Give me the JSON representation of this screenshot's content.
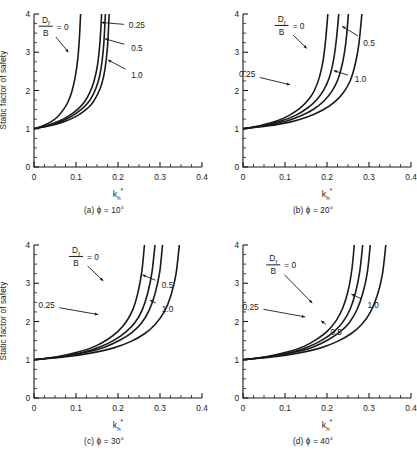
{
  "figure": {
    "axis_labels": {
      "y": "Static factor of safety",
      "x_main": "k",
      "x_sub": "h",
      "x_sup": "*"
    },
    "legend_key": {
      "numerator": "D",
      "numerator_sub": "f",
      "denominator": "B",
      "equals_value": "= 0"
    },
    "x_ticks": [
      "0",
      "0.1",
      "0.2",
      "0.3",
      "0.4"
    ],
    "y_ticks": [
      "0",
      "1.0",
      "2.0",
      "3.0",
      "4.0"
    ],
    "colors": {
      "ink": "#1a1a1a",
      "background": "#ffffff"
    }
  },
  "panels": [
    {
      "id": "a",
      "caption": "(a) ϕ = 10°",
      "phi": 10,
      "labels": [
        "0.25",
        "0.5",
        "1.0"
      ]
    },
    {
      "id": "b",
      "caption": "(b) ϕ = 20°",
      "phi": 20,
      "labels": [
        "0.25",
        "0.5",
        "1.0"
      ]
    },
    {
      "id": "c",
      "caption": "(c) ϕ = 30°",
      "phi": 30,
      "labels": [
        "0.25",
        "0.5",
        "1.0"
      ]
    },
    {
      "id": "d",
      "caption": "(d) ϕ = 40°",
      "phi": 40,
      "labels": [
        "0.25",
        "0.5",
        "1.0"
      ]
    }
  ],
  "chart_data": {
    "type": "line",
    "title": "",
    "xlabel": "k*h (horizontal seismic coefficient)",
    "ylabel": "Static factor of safety",
    "xlim": [
      0,
      0.4
    ],
    "ylim": [
      0,
      4.0
    ],
    "xticks": [
      0,
      0.1,
      0.2,
      0.3,
      0.4
    ],
    "yticks": [
      0,
      1.0,
      2.0,
      3.0,
      4.0
    ],
    "grid": false,
    "legend_position": "in-plot-annotations",
    "series_parameter": "Df/B",
    "panels": [
      {
        "panel": "a",
        "phi_deg": 10,
        "caption": "(a) ϕ = 10°",
        "series": [
          {
            "name": "0",
            "x": [
              0.0,
              0.02,
              0.04,
              0.055,
              0.07,
              0.08,
              0.09,
              0.098,
              0.104,
              0.108,
              0.111
            ],
            "values": [
              1.0,
              1.07,
              1.18,
              1.3,
              1.5,
              1.68,
              1.97,
              2.35,
              2.8,
              3.35,
              4.0
            ]
          },
          {
            "name": "0.25",
            "x": [
              0.0,
              0.03,
              0.06,
              0.085,
              0.105,
              0.12,
              0.133,
              0.143,
              0.151,
              0.157,
              0.161
            ],
            "values": [
              1.0,
              1.08,
              1.2,
              1.35,
              1.52,
              1.7,
              1.95,
              2.25,
              2.65,
              3.25,
              4.0
            ]
          },
          {
            "name": "0.5",
            "x": [
              0.0,
              0.032,
              0.064,
              0.09,
              0.112,
              0.128,
              0.141,
              0.152,
              0.16,
              0.166,
              0.17
            ],
            "values": [
              1.0,
              1.08,
              1.19,
              1.33,
              1.5,
              1.67,
              1.9,
              2.2,
              2.6,
              3.2,
              4.0
            ]
          },
          {
            "name": "1.0",
            "x": [
              0.0,
              0.035,
              0.07,
              0.098,
              0.12,
              0.137,
              0.15,
              0.161,
              0.169,
              0.175,
              0.179
            ],
            "values": [
              1.0,
              1.07,
              1.18,
              1.31,
              1.47,
              1.64,
              1.87,
              2.16,
              2.56,
              3.15,
              4.0
            ]
          }
        ]
      },
      {
        "panel": "b",
        "phi_deg": 20,
        "caption": "(b) ϕ = 20°",
        "series": [
          {
            "name": "0",
            "x": [
              0.0,
              0.04,
              0.08,
              0.11,
              0.135,
              0.155,
              0.17,
              0.182,
              0.191,
              0.197,
              0.202
            ],
            "values": [
              1.0,
              1.08,
              1.2,
              1.35,
              1.53,
              1.75,
              2.0,
              2.35,
              2.8,
              3.35,
              4.0
            ]
          },
          {
            "name": "0.25",
            "x": [
              0.0,
              0.045,
              0.09,
              0.125,
              0.152,
              0.174,
              0.191,
              0.205,
              0.215,
              0.222,
              0.228
            ],
            "values": [
              1.0,
              1.08,
              1.2,
              1.35,
              1.53,
              1.74,
              1.99,
              2.32,
              2.76,
              3.3,
              4.0
            ]
          },
          {
            "name": "0.5",
            "x": [
              0.0,
              0.05,
              0.1,
              0.138,
              0.168,
              0.192,
              0.211,
              0.226,
              0.237,
              0.245,
              0.251
            ],
            "values": [
              1.0,
              1.08,
              1.19,
              1.34,
              1.51,
              1.72,
              1.97,
              2.29,
              2.72,
              3.26,
              4.0
            ]
          },
          {
            "name": "1.0",
            "x": [
              0.0,
              0.057,
              0.114,
              0.156,
              0.19,
              0.217,
              0.238,
              0.255,
              0.267,
              0.276,
              0.283
            ],
            "values": [
              1.0,
              1.07,
              1.18,
              1.32,
              1.49,
              1.69,
              1.93,
              2.25,
              2.68,
              3.22,
              4.0
            ]
          }
        ]
      },
      {
        "panel": "c",
        "phi_deg": 30,
        "caption": "(c) ϕ = 30°",
        "series": [
          {
            "name": "0",
            "x": [
              0.0,
              0.055,
              0.105,
              0.145,
              0.175,
              0.2,
              0.22,
              0.236,
              0.248,
              0.257,
              0.263
            ],
            "values": [
              1.0,
              1.08,
              1.2,
              1.35,
              1.53,
              1.74,
              2.0,
              2.33,
              2.78,
              3.33,
              4.0
            ]
          },
          {
            "name": "0.25",
            "x": [
              0.0,
              0.06,
              0.115,
              0.158,
              0.192,
              0.219,
              0.241,
              0.258,
              0.271,
              0.281,
              0.288
            ],
            "values": [
              1.0,
              1.08,
              1.19,
              1.34,
              1.52,
              1.73,
              1.98,
              2.31,
              2.75,
              3.3,
              4.0
            ]
          },
          {
            "name": "0.5",
            "x": [
              0.0,
              0.064,
              0.122,
              0.168,
              0.204,
              0.233,
              0.256,
              0.274,
              0.288,
              0.299,
              0.306
            ],
            "values": [
              1.0,
              1.08,
              1.19,
              1.33,
              1.51,
              1.71,
              1.96,
              2.29,
              2.72,
              3.27,
              4.0
            ]
          },
          {
            "name": "1.0",
            "x": [
              0.0,
              0.072,
              0.138,
              0.19,
              0.231,
              0.263,
              0.289,
              0.31,
              0.326,
              0.338,
              0.346
            ],
            "values": [
              1.0,
              1.07,
              1.18,
              1.31,
              1.48,
              1.68,
              1.93,
              2.25,
              2.68,
              3.23,
              4.0
            ]
          }
        ]
      },
      {
        "panel": "d",
        "phi_deg": 40,
        "caption": "(d) ϕ = 40°",
        "series": [
          {
            "name": "0",
            "x": [
              0.0,
              0.055,
              0.105,
              0.145,
              0.176,
              0.201,
              0.221,
              0.237,
              0.25,
              0.259,
              0.265
            ],
            "values": [
              1.0,
              1.08,
              1.2,
              1.35,
              1.54,
              1.75,
              2.01,
              2.34,
              2.79,
              3.34,
              4.0
            ]
          },
          {
            "name": "0.25",
            "x": [
              0.0,
              0.059,
              0.113,
              0.156,
              0.189,
              0.216,
              0.238,
              0.255,
              0.268,
              0.278,
              0.285
            ],
            "values": [
              1.0,
              1.08,
              1.19,
              1.34,
              1.52,
              1.73,
              1.99,
              2.32,
              2.76,
              3.31,
              4.0
            ]
          },
          {
            "name": "0.5",
            "x": [
              0.0,
              0.063,
              0.12,
              0.166,
              0.201,
              0.23,
              0.253,
              0.271,
              0.285,
              0.296,
              0.303
            ],
            "values": [
              1.0,
              1.08,
              1.19,
              1.33,
              1.51,
              1.72,
              1.97,
              2.3,
              2.73,
              3.28,
              4.0
            ]
          },
          {
            "name": "1.0",
            "x": [
              0.0,
              0.07,
              0.134,
              0.185,
              0.225,
              0.257,
              0.283,
              0.304,
              0.32,
              0.332,
              0.34
            ],
            "values": [
              1.0,
              1.07,
              1.18,
              1.31,
              1.48,
              1.68,
              1.93,
              2.26,
              2.69,
              3.24,
              4.0
            ]
          }
        ]
      }
    ]
  }
}
